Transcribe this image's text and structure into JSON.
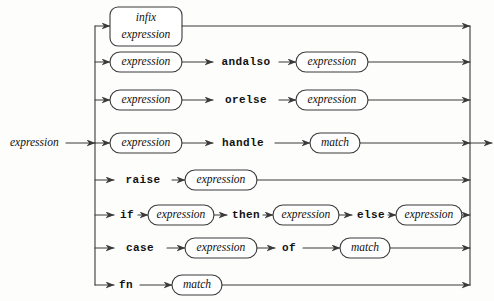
{
  "diagram": {
    "title": "expression",
    "type": "railroad-syntax-diagram",
    "entry_label": "expression",
    "colors": {
      "line": "#3a3a3a",
      "text": "#111111",
      "background": "#fdfdfc",
      "box_fill": "#ffffff"
    },
    "rails": {
      "left_rail_x": 95,
      "right_rail_x": 470,
      "entry_arrow_y": 143,
      "exit_arrow_y": 143
    },
    "alternatives": [
      {
        "id": "infix",
        "y": 26,
        "items": [
          {
            "kind": "nonterminal",
            "label": "infix expression",
            "lines": [
              "infix",
              "expression"
            ],
            "x": 110,
            "w": 72,
            "multiline": true
          }
        ]
      },
      {
        "id": "andalso",
        "y": 62,
        "items": [
          {
            "kind": "nonterminal",
            "label": "expression",
            "x": 110,
            "w": 72
          },
          {
            "kind": "keyword",
            "label": "andalso",
            "x": 219,
            "w": 54
          },
          {
            "kind": "nonterminal",
            "label": "expression",
            "x": 296,
            "w": 72
          }
        ]
      },
      {
        "id": "orelse",
        "y": 100,
        "items": [
          {
            "kind": "nonterminal",
            "label": "expression",
            "x": 110,
            "w": 72
          },
          {
            "kind": "keyword",
            "label": "orelse",
            "x": 219,
            "w": 47
          },
          {
            "kind": "nonterminal",
            "label": "expression",
            "x": 296,
            "w": 72
          }
        ]
      },
      {
        "id": "handle",
        "y": 143,
        "items": [
          {
            "kind": "nonterminal",
            "label": "expression",
            "x": 110,
            "w": 72
          },
          {
            "kind": "keyword",
            "label": "handle",
            "x": 219,
            "w": 47
          },
          {
            "kind": "nonterminal",
            "label": "match",
            "x": 310,
            "w": 50
          }
        ]
      },
      {
        "id": "raise",
        "y": 180,
        "items": [
          {
            "kind": "keyword",
            "label": "raise",
            "x": 117,
            "w": 40
          },
          {
            "kind": "nonterminal",
            "label": "expression",
            "x": 185,
            "w": 72
          }
        ]
      },
      {
        "id": "if-then-else",
        "y": 215,
        "items": [
          {
            "kind": "keyword",
            "label": "if",
            "x": 117,
            "w": 17
          },
          {
            "kind": "nonterminal",
            "label": "expression",
            "x": 148,
            "w": 66
          },
          {
            "kind": "keyword",
            "label": "then",
            "x": 227,
            "w": 32
          },
          {
            "kind": "nonterminal",
            "label": "expression",
            "x": 273,
            "w": 66
          },
          {
            "kind": "keyword",
            "label": "else",
            "x": 352,
            "w": 32
          },
          {
            "kind": "nonterminal",
            "label": "expression",
            "x": 396,
            "w": 66
          }
        ]
      },
      {
        "id": "case-of",
        "y": 248,
        "items": [
          {
            "kind": "keyword",
            "label": "case",
            "x": 117,
            "w": 34
          },
          {
            "kind": "nonterminal",
            "label": "expression",
            "x": 185,
            "w": 72
          },
          {
            "kind": "keyword",
            "label": "of",
            "x": 278,
            "w": 20
          },
          {
            "kind": "nonterminal",
            "label": "match",
            "x": 340,
            "w": 50
          }
        ]
      },
      {
        "id": "fn-match",
        "y": 285,
        "items": [
          {
            "kind": "keyword",
            "label": "fn",
            "x": 117,
            "w": 18
          },
          {
            "kind": "nonterminal",
            "label": "match",
            "x": 172,
            "w": 50
          }
        ]
      }
    ]
  }
}
